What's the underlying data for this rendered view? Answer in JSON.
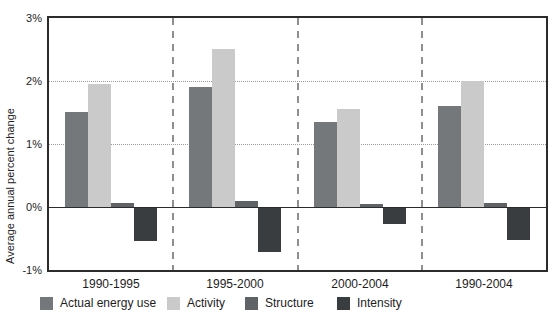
{
  "chart_data": {
    "type": "bar",
    "title": "",
    "ylabel": "Average annual percent change",
    "xlabel": "",
    "categories": [
      "1990-1995",
      "1995-2000",
      "2000-2004",
      "1990-2004"
    ],
    "series": [
      {
        "name": "Actual energy use",
        "color": "#75787a",
        "values": [
          1.5,
          1.9,
          1.35,
          1.6
        ]
      },
      {
        "name": "Activity",
        "color": "#c9cac9",
        "values": [
          1.95,
          2.5,
          1.55,
          2.0
        ]
      },
      {
        "name": "Structure",
        "color": "#5f6366",
        "values": [
          0.07,
          0.1,
          0.05,
          0.07
        ]
      },
      {
        "name": "Intensity",
        "color": "#3a3d3f",
        "values": [
          -0.52,
          -0.7,
          -0.25,
          -0.5
        ]
      }
    ],
    "ylim": [
      -1,
      3
    ],
    "yticks": [
      "3%",
      "2%",
      "1%",
      "0%",
      "-1%"
    ],
    "ytick_values": [
      3,
      2,
      1,
      0,
      -1
    ],
    "grid": "dotted horizontal lines at 1% and 2%, solid zero line, dashed vertical separators between category panels",
    "legend_position": "bottom",
    "frame_color": "#2b2b2b"
  }
}
